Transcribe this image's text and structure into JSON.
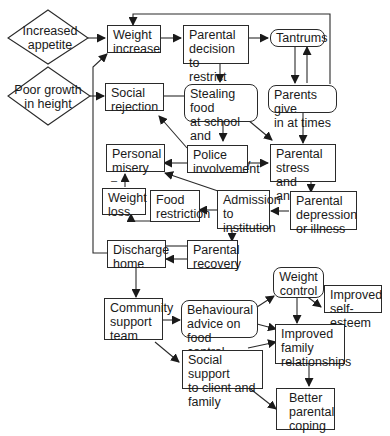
{
  "diagram": {
    "type": "flowchart",
    "colors": {
      "stroke": "#2a2a2a",
      "text": "#1a1a1a",
      "background": "#ffffff"
    },
    "causes": [
      {
        "id": "increased-appetite",
        "shape": "diamond",
        "label": "Increased\nappetite"
      },
      {
        "id": "poor-growth",
        "shape": "diamond",
        "label": "Poor growth\nin height"
      }
    ],
    "nodes": {
      "weight_increase": "Weight\nincrease",
      "parental_decision": "Parental\ndecision to\nrestrict food",
      "tantrums": "Tantrums",
      "parents_give_in": "Parents give\nin at times",
      "social_rejection": "Social\nrejection",
      "stealing_food": "Stealing  food\nat  school and\nin community",
      "personal_misery": "Personal\nmisery",
      "police_involvement": "Police\ninvolvement",
      "parental_stress": "Parental\nstress and\nanxiety",
      "weight_loss": "Weight\nloss",
      "food_restriction": "Food\nrestriction",
      "admission": "Admission\nto\ninstitution",
      "parental_depression": "Parental\ndepression\nor illness",
      "discharge_home": "Discharge\nhome",
      "parental_recovery": "Parental\nrecovery",
      "weight_control": "Weight\ncontrol",
      "improved_self_esteem": "Improved\nself-esteem",
      "community_support": "Community\nsupport\nteam",
      "behavioural_advice": "Behavioural\nadvice on\nfood control",
      "improved_family": "Improved\nfamily\nrelationships",
      "social_support": "Social support\nto client and\nfamily",
      "better_coping": "Better\nparental\ncoping"
    },
    "marks": {
      "minus": "–"
    },
    "edges": [
      [
        "Increased appetite",
        "Weight increase"
      ],
      [
        "Poor growth in height",
        "Social rejection"
      ],
      [
        "Weight increase",
        "Parental decision to restrict food"
      ],
      [
        "Parental decision to restrict food",
        "Tantrums"
      ],
      [
        "Parental decision to restrict food",
        "Stealing food at school and in community"
      ],
      [
        "Tantrums",
        "Parents give in at times"
      ],
      [
        "Parents give in at times",
        "Tantrums"
      ],
      [
        "Parents give in at times",
        "Weight increase"
      ],
      [
        "Parents give in at times",
        "Parental stress and anxiety"
      ],
      [
        "Stealing food at school and in community",
        "Social rejection"
      ],
      [
        "Stealing food at school and in community",
        "Police involvement"
      ],
      [
        "Stealing food at school and in community",
        "Parental stress and anxiety"
      ],
      [
        "Police involvement",
        "Social rejection"
      ],
      [
        "Police involvement",
        "Personal misery"
      ],
      [
        "Police involvement",
        "Parental stress and anxiety"
      ],
      [
        "Parental stress and anxiety",
        "Parental depression or illness"
      ],
      [
        "Parental depression or illness",
        "Admission to institution"
      ],
      [
        "Admission to institution",
        "Personal misery"
      ],
      [
        "Admission to institution",
        "Food restriction"
      ],
      [
        "Admission to institution",
        "Parental recovery"
      ],
      [
        "Food restriction",
        "Weight loss"
      ],
      [
        "Weight loss",
        "Personal misery"
      ],
      [
        "Parental recovery",
        "Discharge home"
      ],
      [
        "Discharge home",
        "Weight increase"
      ],
      [
        "Discharge home",
        "Community support team"
      ],
      [
        "Community support team",
        "Behavioural advice on food control"
      ],
      [
        "Community support team",
        "Social support to client and family"
      ],
      [
        "Behavioural advice on food control",
        "Weight control"
      ],
      [
        "Behavioural advice on food control",
        "Improved family relationships"
      ],
      [
        "Weight control",
        "Improved self-esteem"
      ],
      [
        "Weight control",
        "Improved family relationships"
      ],
      [
        "Social support to client and family",
        "Improved family relationships"
      ],
      [
        "Social support to client and family",
        "Better parental coping"
      ],
      [
        "Improved family relationships",
        "Better parental coping"
      ]
    ]
  }
}
